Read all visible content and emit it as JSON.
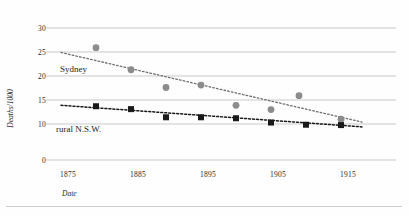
{
  "chart_data": {
    "type": "scatter",
    "title": "",
    "xlabel": "Date",
    "ylabel": "Deaths/1000",
    "grid": true,
    "legend_position": "inline-annotation",
    "xlim": [
      1870,
      1920
    ],
    "xticks": [
      1875,
      1885,
      1895,
      1905,
      1915
    ],
    "xtick_labels": [
      "1875",
      "1885",
      "1895",
      "1905",
      "1915"
    ],
    "ylim": [
      0,
      30
    ],
    "yticks": [
      30,
      25,
      20,
      15,
      10,
      0
    ],
    "ytick_labels": [
      "30",
      "25",
      "20",
      "15",
      "10",
      "0"
    ],
    "series": [
      {
        "name": "Sydney",
        "marker": "circle",
        "color": "#8c8c8c",
        "trendline": true,
        "trendline_style": "dotted",
        "points": [
          {
            "x": 1879,
            "y": 25.9
          },
          {
            "x": 1884,
            "y": 21.3
          },
          {
            "x": 1889,
            "y": 17.6
          },
          {
            "x": 1894,
            "y": 18.1
          },
          {
            "x": 1899,
            "y": 13.9
          },
          {
            "x": 1904,
            "y": 13.0
          },
          {
            "x": 1908,
            "y": 15.9
          },
          {
            "x": 1914,
            "y": 11.0
          }
        ],
        "trendline_endpoints": [
          {
            "x": 1874,
            "y": 24.9
          },
          {
            "x": 1917,
            "y": 10.4
          }
        ]
      },
      {
        "name": "rural N.S.W.",
        "marker": "square",
        "color": "#1a1a1a",
        "trendline": true,
        "trendline_style": "dotted",
        "points": [
          {
            "x": 1879,
            "y": 13.7
          },
          {
            "x": 1884,
            "y": 13.1
          },
          {
            "x": 1889,
            "y": 11.4
          },
          {
            "x": 1894,
            "y": 11.4
          },
          {
            "x": 1899,
            "y": 11.2
          },
          {
            "x": 1904,
            "y": 10.3
          },
          {
            "x": 1909,
            "y": 9.8
          },
          {
            "x": 1914,
            "y": 9.7
          }
        ],
        "trendline_endpoints": [
          {
            "x": 1874,
            "y": 13.9
          },
          {
            "x": 1917,
            "y": 9.2
          }
        ]
      }
    ]
  },
  "axes": {
    "ylabel": "Deaths/1000",
    "xlabel": "Date"
  },
  "annotations": {
    "sydney": "Sydney",
    "rural": "rural N.S.W."
  }
}
